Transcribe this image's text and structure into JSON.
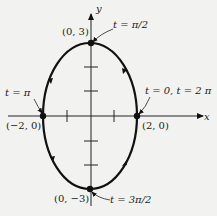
{
  "diagram": {
    "type": "parametric-ellipse",
    "axes": {
      "x_label": "x",
      "y_label": "y"
    },
    "points": [
      {
        "id": "top",
        "coord": "(0, 3)",
        "param": "t = π/2"
      },
      {
        "id": "left",
        "coord": "(−2, 0)",
        "param": "t = π"
      },
      {
        "id": "right",
        "coord": "(2, 0)",
        "param": "t = 0, t = 2 π"
      },
      {
        "id": "bottom",
        "coord": "(0, −3)",
        "param": "t = 3π/2"
      }
    ],
    "direction": "counterclockwise",
    "colors": {
      "curve": "#111111",
      "background": "#f2f2f0"
    }
  }
}
